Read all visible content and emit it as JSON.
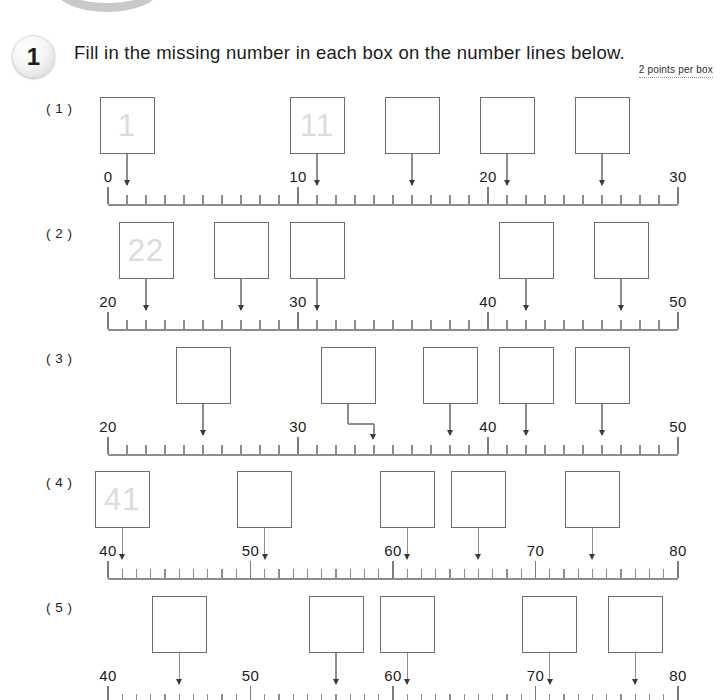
{
  "worksheet": {
    "problem_number": "1",
    "instruction": "Fill in the missing number in each box on the number lines below.",
    "points_note": "2 points per box",
    "colors": {
      "ink": "#1b1b1b",
      "line": "#8d8d8d",
      "box_border": "#6e6e6e",
      "ghost_number": "#dcdcdc",
      "arrow_head": "#3a3a3a"
    }
  },
  "rows": [
    {
      "label": "( 1 )",
      "axis": {
        "min": 0,
        "max": 30,
        "major_step": 10,
        "minor_step": 1
      },
      "tick_labels": [
        "0",
        "10",
        "20",
        "30"
      ],
      "tick_label_values": [
        0,
        10,
        20,
        30
      ],
      "boxes": [
        {
          "value": "1",
          "ghost": "1",
          "arrow_value": 1,
          "elbow": false
        },
        {
          "value": "11",
          "ghost": "11",
          "arrow_value": 11,
          "elbow": false
        },
        {
          "value": "",
          "ghost": "",
          "arrow_value": 16,
          "elbow": false
        },
        {
          "value": "",
          "ghost": "",
          "arrow_value": 21,
          "elbow": false
        },
        {
          "value": "",
          "ghost": "",
          "arrow_value": 26,
          "elbow": false
        }
      ]
    },
    {
      "label": "( 2 )",
      "axis": {
        "min": 20,
        "max": 50,
        "major_step": 10,
        "minor_step": 1
      },
      "tick_labels": [
        "20",
        "30",
        "40",
        "50"
      ],
      "tick_label_values": [
        20,
        30,
        40,
        50
      ],
      "boxes": [
        {
          "value": "22",
          "ghost": "22",
          "arrow_value": 22,
          "elbow": false
        },
        {
          "value": "",
          "ghost": "",
          "arrow_value": 27,
          "elbow": false
        },
        {
          "value": "",
          "ghost": "",
          "arrow_value": 31,
          "elbow": false
        },
        {
          "value": "",
          "ghost": "",
          "arrow_value": 42,
          "elbow": false
        },
        {
          "value": "",
          "ghost": "",
          "arrow_value": 47,
          "elbow": false
        }
      ]
    },
    {
      "label": "( 3 )",
      "axis": {
        "min": 20,
        "max": 50,
        "major_step": 10,
        "minor_step": 1
      },
      "tick_labels": [
        "20",
        "30",
        "40",
        "50"
      ],
      "tick_label_values": [
        20,
        30,
        40,
        50
      ],
      "boxes": [
        {
          "value": "",
          "ghost": "",
          "arrow_value": 25,
          "elbow": false
        },
        {
          "value": "",
          "ghost": "",
          "arrow_value": 34,
          "elbow": true
        },
        {
          "value": "",
          "ghost": "",
          "arrow_value": 38,
          "elbow": false
        },
        {
          "value": "",
          "ghost": "",
          "arrow_value": 42,
          "elbow": false
        },
        {
          "value": "",
          "ghost": "",
          "arrow_value": 46,
          "elbow": false
        }
      ]
    },
    {
      "label": "( 4 )",
      "axis": {
        "min": 40,
        "max": 80,
        "major_step": 10,
        "minor_step": 1
      },
      "tick_labels": [
        "40",
        "50",
        "60",
        "70",
        "80"
      ],
      "tick_label_values": [
        40,
        50,
        60,
        70,
        80
      ],
      "boxes": [
        {
          "value": "41",
          "ghost": "41",
          "arrow_value": 41,
          "elbow": false
        },
        {
          "value": "",
          "ghost": "",
          "arrow_value": 51,
          "elbow": false
        },
        {
          "value": "",
          "ghost": "",
          "arrow_value": 61,
          "elbow": false
        },
        {
          "value": "",
          "ghost": "",
          "arrow_value": 66,
          "elbow": false
        },
        {
          "value": "",
          "ghost": "",
          "arrow_value": 74,
          "elbow": false
        }
      ]
    },
    {
      "label": "( 5 )",
      "axis": {
        "min": 40,
        "max": 80,
        "major_step": 10,
        "minor_step": 1
      },
      "tick_labels": [
        "40",
        "50",
        "60",
        "70",
        "80"
      ],
      "tick_label_values": [
        40,
        50,
        60,
        70,
        80
      ],
      "clipped": true,
      "boxes": [
        {
          "value": "",
          "ghost": "",
          "arrow_value": 45,
          "elbow": false
        },
        {
          "value": "",
          "ghost": "",
          "arrow_value": 56,
          "elbow": false
        },
        {
          "value": "",
          "ghost": "",
          "arrow_value": 61,
          "elbow": false
        },
        {
          "value": "",
          "ghost": "",
          "arrow_value": 71,
          "elbow": false
        },
        {
          "value": "",
          "ghost": "",
          "arrow_value": 77,
          "elbow": false
        }
      ]
    }
  ]
}
